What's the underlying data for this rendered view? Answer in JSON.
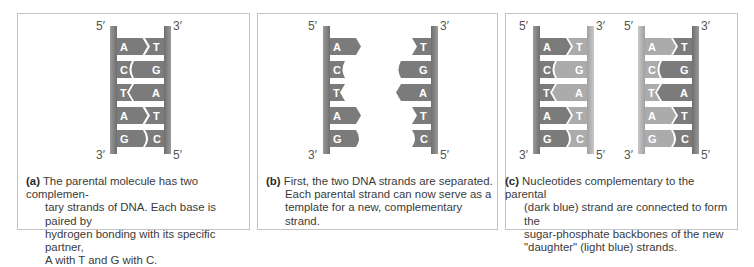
{
  "figure": {
    "colors": {
      "parental_strand": "#7b7b7b",
      "daughter_strand": "#ababab",
      "backbone": "#8a8a8a",
      "border": "#c4c4c4",
      "text": "#3a3a3a"
    },
    "panels": [
      {
        "id": "a",
        "tag": "(a)",
        "caption": "The parental molecule has two complementary strands of DNA. Each base is paired by hydrogen bonding with its specific partner, A with T and G with C.",
        "labels": {
          "top_left": "5′",
          "top_right": "3′",
          "bottom_left": "3′",
          "bottom_right": "5′"
        },
        "pairs": [
          [
            "A",
            "T"
          ],
          [
            "C",
            "G"
          ],
          [
            "T",
            "A"
          ],
          [
            "A",
            "T"
          ],
          [
            "G",
            "C"
          ]
        ]
      },
      {
        "id": "b",
        "tag": "(b)",
        "caption": "First, the two DNA strands are separated. Each parental strand can now serve as a template for a new, complementary strand.",
        "labels": {
          "top_left": "5′",
          "top_right": "3′",
          "bottom_left": "3′",
          "bottom_right": "5′"
        },
        "left_bases": [
          "A",
          "C",
          "T",
          "A",
          "G"
        ],
        "right_bases": [
          "T",
          "G",
          "A",
          "T",
          "C"
        ]
      },
      {
        "id": "c",
        "tag": "(c)",
        "caption": "Nucleotides complementary to the parental (dark blue) strand are connected to form the sugar-phosphate backbones of the new \"daughter\" (light blue) strands.",
        "molecules": [
          {
            "labels": {
              "top_left": "5′",
              "top_right": "3′",
              "bottom_left": "3′",
              "bottom_right": "5′"
            },
            "pairs": [
              [
                "A",
                "T"
              ],
              [
                "C",
                "G"
              ],
              [
                "T",
                "A"
              ],
              [
                "A",
                "T"
              ],
              [
                "G",
                "C"
              ]
            ]
          },
          {
            "labels": {
              "top_left": "5′",
              "top_right": "3′",
              "bottom_left": "3′",
              "bottom_right": "5′"
            },
            "pairs": [
              [
                "A",
                "T"
              ],
              [
                "C",
                "G"
              ],
              [
                "T",
                "A"
              ],
              [
                "A",
                "T"
              ],
              [
                "G",
                "C"
              ]
            ]
          }
        ]
      }
    ],
    "caption_lines": {
      "a": [
        "The parental molecule has two complemen-",
        "tary strands of DNA. Each base is paired by",
        "hydrogen bonding with its specific partner,",
        "A with T and G with C."
      ],
      "b": [
        "First, the two DNA strands are separated.",
        "Each parental strand can now serve as a",
        "template for a new, complementary",
        "strand."
      ],
      "c": [
        "Nucleotides complementary to the parental",
        "(dark blue) strand are connected to form the",
        "sugar-phosphate backbones of the new",
        "\"daughter\" (light blue) strands."
      ]
    }
  }
}
